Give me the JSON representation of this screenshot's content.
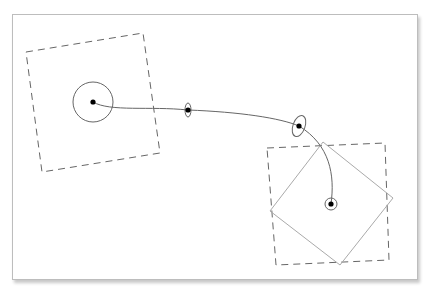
{
  "header": {
    "partial_text": "..."
  },
  "diagram": {
    "colors": {
      "dashed": "#666666",
      "path": "#666666",
      "diamond": "#aaaaaa",
      "dot": "#000000",
      "frame": "#bdbdbd"
    },
    "start_box": {
      "points": "26,52 143,33 160,153 42,172"
    },
    "end_box": {
      "points": "267,148 385,143 389,260 276,265"
    },
    "end_diamond": {
      "points": "323,142 393,198 340,265 270,211"
    },
    "trajectory": "M93,102 C110,112 150,106 188,110 C240,112 280,118 299,126 C330,145 335,175 331,204",
    "nodes": [
      {
        "cx": 93,
        "cy": 102,
        "ring_rx": 20,
        "ring_ry": 20
      },
      {
        "cx": 188,
        "cy": 110,
        "ring_rx": 3,
        "ring_ry": 7
      },
      {
        "cx": 299,
        "cy": 126,
        "ring_rx": 6,
        "ring_ry": 11
      },
      {
        "cx": 331,
        "cy": 204,
        "ring_rx": 6,
        "ring_ry": 6
      }
    ]
  }
}
